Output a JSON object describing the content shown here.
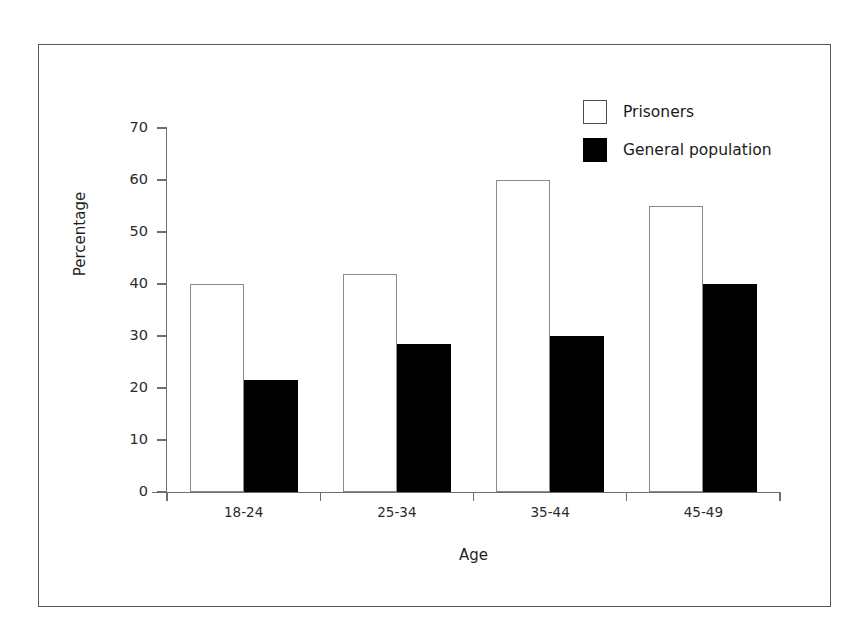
{
  "figure": {
    "background_color": "#ffffff",
    "frame_color": "#595959",
    "axis_color": "#6e6e6e"
  },
  "axes": {
    "y_title": "Percentage",
    "x_title": "Age",
    "y_ticks": [
      "0",
      "10",
      "20",
      "30",
      "40",
      "50",
      "60",
      "70"
    ]
  },
  "legend": {
    "items": [
      {
        "label": "Prisoners",
        "swatch": "open-square",
        "color": "#ffffff"
      },
      {
        "label": "General population",
        "swatch": "filled-square",
        "color": "#000000"
      }
    ]
  },
  "chart_data": {
    "type": "bar",
    "title": "",
    "xlabel": "Age",
    "ylabel": "Percentage",
    "ylim": [
      0,
      70
    ],
    "ytick_step": 10,
    "grid": false,
    "legend_position": "top-right",
    "categories": [
      "18-24",
      "25-34",
      "35-44",
      "45-49"
    ],
    "series": [
      {
        "name": "Prisoners",
        "color": "#ffffff",
        "edge_color": "#8a8a8a",
        "values": [
          40,
          42,
          60,
          55
        ]
      },
      {
        "name": "General population",
        "color": "#000000",
        "edge_color": "#000000",
        "values": [
          21.5,
          28.5,
          30,
          40
        ]
      }
    ]
  }
}
